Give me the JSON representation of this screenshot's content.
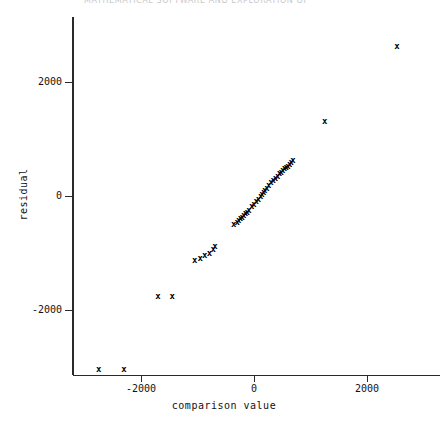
{
  "header": {
    "clipped_text": "MATHEMATICAL SOFTWARE AND EXPLORATION OF"
  },
  "chart_data": {
    "type": "scatter",
    "title": "",
    "xlabel": "comparison value",
    "ylabel": "residual",
    "xlim": [
      -3000,
      3250
    ],
    "ylim": [
      -3250,
      3150
    ],
    "xticks": [
      -2000,
      0,
      2000
    ],
    "xtick_labels": [
      "-2000",
      "0",
      "2000"
    ],
    "yticks": [
      2000,
      0,
      -2000
    ],
    "ytick_labels": [
      "2000",
      "0",
      "-2000"
    ],
    "grid": false,
    "legend": null,
    "marker": "x",
    "marker_color": "#000000",
    "series": [
      {
        "name": "residual vs comparison value",
        "points": [
          [
            -2750,
            -3050
          ],
          [
            -2300,
            -3050
          ],
          [
            -1700,
            -1770
          ],
          [
            -1450,
            -1770
          ],
          [
            -1050,
            -1130
          ],
          [
            -950,
            -1090
          ],
          [
            -870,
            -1040
          ],
          [
            -790,
            -1000
          ],
          [
            -720,
            -930
          ],
          [
            -690,
            -880
          ],
          [
            -360,
            -500
          ],
          [
            -300,
            -460
          ],
          [
            -270,
            -430
          ],
          [
            -240,
            -400
          ],
          [
            -210,
            -370
          ],
          [
            -180,
            -340
          ],
          [
            -150,
            -310
          ],
          [
            -120,
            -280
          ],
          [
            -90,
            -250
          ],
          [
            -40,
            -190
          ],
          [
            0,
            -140
          ],
          [
            40,
            -100
          ],
          [
            80,
            -60
          ],
          [
            120,
            0
          ],
          [
            140,
            30
          ],
          [
            170,
            60
          ],
          [
            190,
            90
          ],
          [
            230,
            140
          ],
          [
            260,
            180
          ],
          [
            300,
            230
          ],
          [
            340,
            270
          ],
          [
            380,
            310
          ],
          [
            420,
            350
          ],
          [
            450,
            390
          ],
          [
            480,
            420
          ],
          [
            510,
            450
          ],
          [
            540,
            480
          ],
          [
            570,
            500
          ],
          [
            600,
            520
          ],
          [
            630,
            550
          ],
          [
            660,
            580
          ],
          [
            690,
            620
          ],
          [
            1250,
            1300
          ],
          [
            2530,
            2630
          ]
        ]
      }
    ]
  }
}
